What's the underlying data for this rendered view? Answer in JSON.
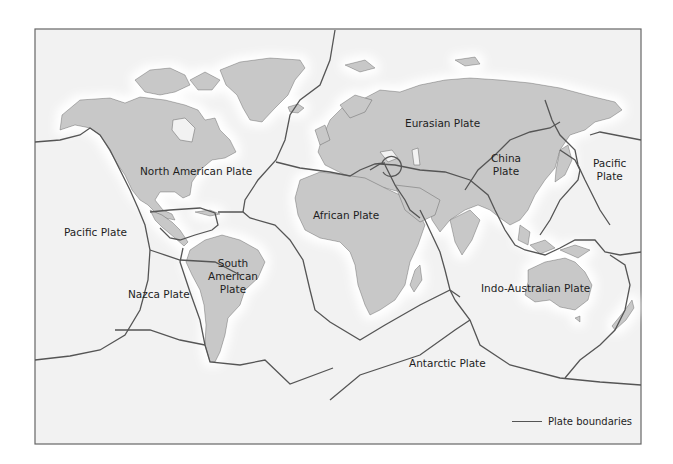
{
  "map": {
    "title": "",
    "colors": {
      "ocean": "#f2f2f2",
      "land": "#c8c8c8",
      "boundary": "#555555",
      "frame": "#666666"
    },
    "plates": [
      {
        "id": "north-american",
        "label": "North American Plate"
      },
      {
        "id": "eurasian",
        "label": "Eurasian Plate"
      },
      {
        "id": "china",
        "label": "China\nPlate",
        "lines": [
          "China",
          "Plate"
        ]
      },
      {
        "id": "pacific-east",
        "label": "Pacific\nPlate",
        "lines": [
          "Pacific",
          "Plate"
        ]
      },
      {
        "id": "pacific-west",
        "label": "Pacific Plate"
      },
      {
        "id": "african",
        "label": "African Plate"
      },
      {
        "id": "south-american",
        "label": "South\nAmerican\nPlate",
        "lines": [
          "South",
          "American",
          "Plate"
        ]
      },
      {
        "id": "nazca",
        "label": "Nazca Plate"
      },
      {
        "id": "indo-australian",
        "label": "Indo-Australian Plate"
      },
      {
        "id": "antarctic",
        "label": "Antarctic Plate"
      }
    ],
    "legend": {
      "label": "Plate boundaries"
    }
  }
}
